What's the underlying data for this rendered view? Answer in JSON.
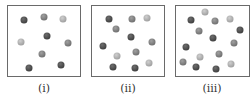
{
  "figure": {
    "panels": [
      {
        "label": "(i)",
        "box": {
          "x": 7,
          "y": 5,
          "w": 74,
          "h": 72
        },
        "particle_count": 9,
        "dots": [
          {
            "x": 24,
            "y": 20,
            "shade": "dark"
          },
          {
            "x": 44,
            "y": 17,
            "shade": "mid"
          },
          {
            "x": 63,
            "y": 19,
            "shade": "light"
          },
          {
            "x": 47,
            "y": 36,
            "shade": "dark"
          },
          {
            "x": 21,
            "y": 42,
            "shade": "light"
          },
          {
            "x": 68,
            "y": 43,
            "shade": "mid"
          },
          {
            "x": 42,
            "y": 54,
            "shade": "mid"
          },
          {
            "x": 29,
            "y": 68,
            "shade": "dark"
          },
          {
            "x": 61,
            "y": 65,
            "shade": "dark"
          }
        ]
      },
      {
        "label": "(ii)",
        "box": {
          "x": 91,
          "y": 5,
          "w": 74,
          "h": 72
        },
        "particle_count": 12,
        "dots": [
          {
            "x": 109,
            "y": 19,
            "shade": "dark"
          },
          {
            "x": 132,
            "y": 19,
            "shade": "mid"
          },
          {
            "x": 147,
            "y": 18,
            "shade": "light"
          },
          {
            "x": 116,
            "y": 29,
            "shade": "mid"
          },
          {
            "x": 131,
            "y": 37,
            "shade": "dark"
          },
          {
            "x": 103,
            "y": 46,
            "shade": "dark"
          },
          {
            "x": 152,
            "y": 42,
            "shade": "mid"
          },
          {
            "x": 117,
            "y": 56,
            "shade": "light"
          },
          {
            "x": 136,
            "y": 52,
            "shade": "mid"
          },
          {
            "x": 113,
            "y": 67,
            "shade": "dark"
          },
          {
            "x": 135,
            "y": 68,
            "shade": "dark"
          },
          {
            "x": 149,
            "y": 63,
            "shade": "light"
          }
        ]
      },
      {
        "label": "(iii)",
        "box": {
          "x": 175,
          "y": 5,
          "w": 75,
          "h": 72
        },
        "particle_count": 15,
        "dots": [
          {
            "x": 205,
            "y": 12,
            "shade": "light"
          },
          {
            "x": 191,
            "y": 20,
            "shade": "dark"
          },
          {
            "x": 215,
            "y": 21,
            "shade": "mid"
          },
          {
            "x": 230,
            "y": 19,
            "shade": "light"
          },
          {
            "x": 199,
            "y": 31,
            "shade": "mid"
          },
          {
            "x": 240,
            "y": 30,
            "shade": "dark"
          },
          {
            "x": 213,
            "y": 38,
            "shade": "dark"
          },
          {
            "x": 234,
            "y": 43,
            "shade": "mid"
          },
          {
            "x": 186,
            "y": 47,
            "shade": "dark"
          },
          {
            "x": 219,
            "y": 54,
            "shade": "mid"
          },
          {
            "x": 200,
            "y": 57,
            "shade": "light"
          },
          {
            "x": 183,
            "y": 62,
            "shade": "mid"
          },
          {
            "x": 196,
            "y": 67,
            "shade": "dark"
          },
          {
            "x": 216,
            "y": 69,
            "shade": "dark"
          },
          {
            "x": 231,
            "y": 64,
            "shade": "light"
          }
        ]
      }
    ],
    "colors": {
      "dark": "#4a4a4a",
      "mid": "#7a7a7a",
      "light": "#a9a9a9",
      "border": "#6a6a6a"
    }
  }
}
